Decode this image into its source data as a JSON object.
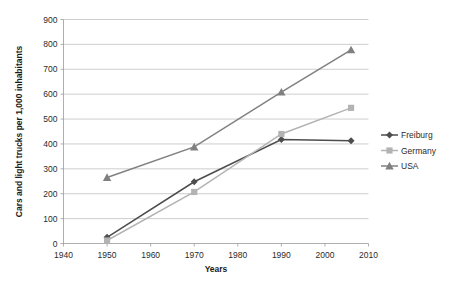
{
  "chart_data": {
    "type": "line",
    "title": "",
    "subtitle": "",
    "xlabel": "Years",
    "ylabel": "Cars and light trucks per 1,000 inhabitants",
    "x": [
      1950,
      1970,
      1990,
      2006
    ],
    "xlim": [
      1940,
      2010
    ],
    "ylim": [
      0,
      900
    ],
    "xticks": [
      1940,
      1950,
      1960,
      1970,
      1980,
      1990,
      2000,
      2010
    ],
    "xtick_labels": [
      "1940",
      "1950",
      "1960",
      "1970",
      "1980",
      "1990",
      "2000",
      "2010"
    ],
    "yticks": [
      0,
      100,
      200,
      300,
      400,
      500,
      600,
      700,
      800,
      900
    ],
    "ytick_labels": [
      "0",
      "100",
      "200",
      "300",
      "400",
      "500",
      "600",
      "700",
      "800",
      "900"
    ],
    "grid": "horizontal",
    "legend_position": "right",
    "series": [
      {
        "name": "Freiburg",
        "marker": "diamond",
        "color": "#4d4d4d",
        "values": [
          25,
          248,
          418,
          413
        ]
      },
      {
        "name": "Germany",
        "marker": "square",
        "color": "#b3b3b3",
        "values": [
          12,
          207,
          440,
          545
        ]
      },
      {
        "name": "USA",
        "marker": "triangle",
        "color": "#808080",
        "values": [
          265,
          388,
          608,
          778
        ]
      }
    ]
  },
  "axes": {
    "x_title": "Years",
    "y_title": "Cars and light trucks per 1,000 inhabitants"
  },
  "legend": {
    "entries": [
      {
        "label": "Freiburg"
      },
      {
        "label": "Germany"
      },
      {
        "label": "USA"
      }
    ]
  }
}
